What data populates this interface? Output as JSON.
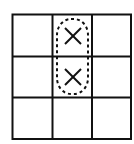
{
  "diagram": {
    "type": "tic-tac-toe-grid",
    "rows": 3,
    "cols": 3,
    "cells": [
      [
        "",
        "X",
        ""
      ],
      [
        "",
        "X",
        ""
      ],
      [
        "",
        "",
        ""
      ]
    ],
    "highlight": {
      "style": "dashed-oval",
      "cells": [
        [
          0,
          1
        ],
        [
          1,
          1
        ]
      ]
    },
    "colors": {
      "line": "#111111",
      "background": "#ffffff"
    }
  }
}
